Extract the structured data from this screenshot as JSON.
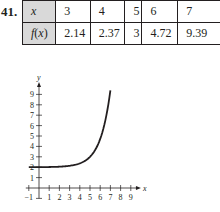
{
  "problem": {
    "number": "41."
  },
  "table": {
    "row_labels": [
      "x",
      "f(x)"
    ],
    "x": [
      "3",
      "4",
      "5",
      "6",
      "7"
    ],
    "fx": [
      "2.14",
      "2.37",
      "3",
      "4.72",
      "9.39"
    ]
  },
  "chart_data": {
    "type": "line",
    "title": "",
    "xlabel": "x",
    "ylabel": "y",
    "xlim": [
      -1,
      9.6
    ],
    "ylim": [
      -1,
      9.8
    ],
    "xticks": [
      -1,
      1,
      2,
      3,
      4,
      5,
      6,
      7,
      8,
      9
    ],
    "yticks": [
      1,
      2,
      3,
      4,
      5,
      6,
      7,
      8,
      9
    ],
    "xtick_labels": [
      "−1",
      "1",
      "2",
      "3",
      "4",
      "5",
      "6",
      "7",
      "8",
      "9"
    ],
    "ytick_labels": [
      "1",
      "2",
      "3",
      "4",
      "5",
      "6",
      "7",
      "8",
      "9",
      ""
    ],
    "grid": false,
    "series": [
      {
        "name": "f(x) = 2 + e^(x-5)",
        "x": [
          -1,
          0,
          1,
          2,
          3,
          4,
          4.5,
          5,
          5.5,
          6,
          6.5,
          7
        ],
        "y": [
          2.0,
          2.01,
          2.02,
          2.05,
          2.14,
          2.37,
          2.61,
          3.0,
          3.65,
          4.72,
          6.48,
          9.39
        ]
      }
    ]
  }
}
